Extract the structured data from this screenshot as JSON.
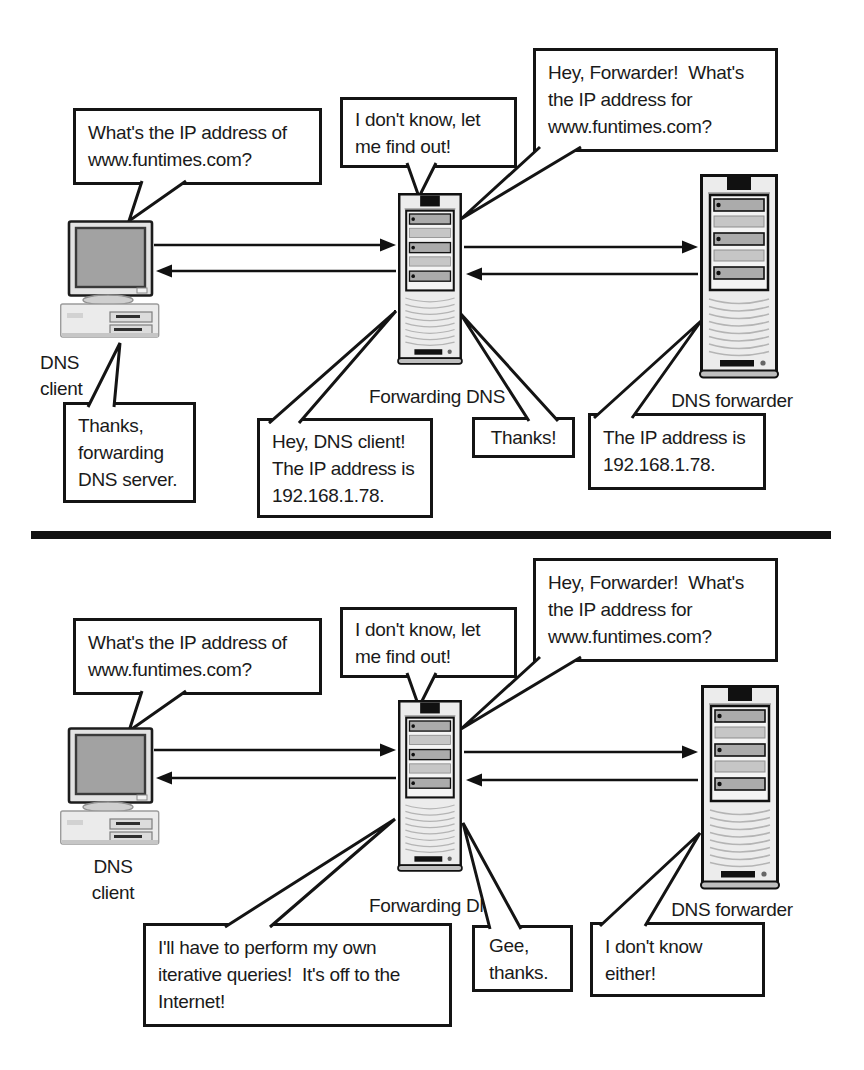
{
  "colors": {
    "background": "#ffffff",
    "ink": "#1a1a1a",
    "bubble_border": "#141414",
    "machine_light_gray": "#ececec",
    "machine_mid_gray": "#ababab",
    "screen_gray": "#a2a2a2"
  },
  "icons": {
    "client_machine": "desktop-computer-icon",
    "server_machine": "tower-server-icon",
    "message_arrows": "arrow-icon"
  },
  "panels": [
    {
      "bubbles": {
        "client_question": "What's the IP address of\nwww.funtimes.com?",
        "dont_know": "I don't know, let\nme find out!",
        "hey_forwarder": "Hey, Forwarder!  What's\nthe IP address for\nwww.funtimes.com?",
        "client_thanks": "Thanks,\nforwarding\nDNS server.",
        "answer_to_client": "Hey, DNS client!\nThe IP address is\n192.168.1.78.",
        "thanks_to_forwarder": "Thanks!",
        "forwarder_answer": "The IP address is\n192.168.1.78."
      },
      "labels": {
        "client": "DNS\nclient",
        "middle_server": "Forwarding DNS",
        "right_server": "DNS forwarder"
      }
    },
    {
      "bubbles": {
        "client_question": "What's the IP address of\nwww.funtimes.com?",
        "dont_know": "I don't know, let\nme find out!",
        "hey_forwarder": "Hey, Forwarder!  What's\nthe IP address for\nwww.funtimes.com?",
        "iterative": "I'll have to perform my own\niterative queries!  It's off to the\nInternet!",
        "gee_thanks": "Gee,\nthanks.",
        "dont_know_either": "I don't know\neither!"
      },
      "labels": {
        "client": "DNS\nclient",
        "middle_server": "Forwarding DNS",
        "right_server": "DNS forwarder"
      }
    }
  ]
}
